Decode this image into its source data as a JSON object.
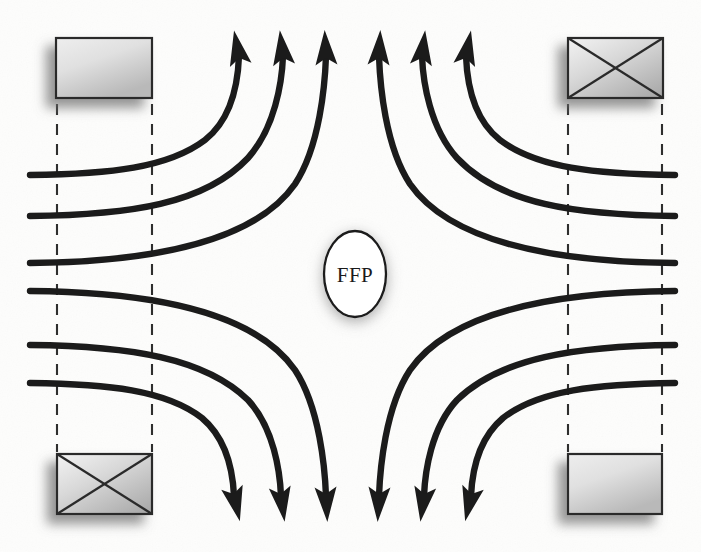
{
  "figure": {
    "name": "field-free-point-diagram",
    "width": 701,
    "height": 552,
    "background_color": "#fdfdfc",
    "line_color": "#1b1b1b",
    "dashed_line_color": "#2a2a2a",
    "box_fill_light": "#e8e8e8",
    "box_fill_dark": "#b4b4b4",
    "box_stroke": "#2a2a2a",
    "shadow_color": "#9a9a9a"
  },
  "center_marker": {
    "label": "FFP",
    "shape": "ellipse",
    "cx": 355,
    "cy": 274,
    "rx": 31,
    "ry": 43,
    "fill": "#ffffff",
    "stroke": "#1a1a1a"
  },
  "magnets": [
    {
      "id": "magnet-top-left",
      "position": "top-left",
      "style": "plain",
      "x": 56,
      "y": 38,
      "width": 96,
      "height": 60
    },
    {
      "id": "magnet-top-right",
      "position": "top-right",
      "style": "crossed",
      "x": 568,
      "y": 38,
      "width": 95,
      "height": 60
    },
    {
      "id": "magnet-bottom-left",
      "position": "bottom-left",
      "style": "crossed",
      "x": 57,
      "y": 454,
      "width": 95,
      "height": 60
    },
    {
      "id": "magnet-bottom-right",
      "position": "bottom-right",
      "style": "plain",
      "x": 568,
      "y": 454,
      "width": 94,
      "height": 60
    }
  ],
  "dashed_guides": [
    {
      "id": "guide-left-inner",
      "x": 57,
      "y1": 104,
      "y2": 450
    },
    {
      "id": "guide-left-outer",
      "x": 152,
      "y1": 104,
      "y2": 450
    },
    {
      "id": "guide-right-inner",
      "x": 568,
      "y1": 104,
      "y2": 450
    },
    {
      "id": "guide-right-outer",
      "x": 662,
      "y1": 104,
      "y2": 450
    }
  ],
  "field_lines": {
    "count": 12,
    "description": "Quadrupole magnetic field lines converging on a field-free point",
    "upper_left_group": [
      {
        "id": "fl-ul-1",
        "start": [
          30,
          175
        ],
        "arrow_tip": [
          228,
          30
        ],
        "arrow_angle": -12
      },
      {
        "id": "fl-ul-2",
        "start": [
          30,
          216
        ],
        "arrow_tip": [
          272,
          30
        ],
        "arrow_angle": -10
      },
      {
        "id": "fl-ul-3",
        "start": [
          30,
          263
        ],
        "arrow_tip": [
          318,
          30
        ],
        "arrow_angle": -6
      }
    ],
    "upper_right_group": [
      {
        "id": "fl-ur-1",
        "start": [
          675,
          175
        ],
        "arrow_tip": [
          488,
          30
        ],
        "arrow_angle": 12
      },
      {
        "id": "fl-ur-2",
        "start": [
          675,
          216
        ],
        "arrow_tip": [
          440,
          30
        ],
        "arrow_angle": 10
      },
      {
        "id": "fl-ur-3",
        "start": [
          675,
          263
        ],
        "arrow_tip": [
          392,
          30
        ],
        "arrow_angle": 6
      }
    ],
    "lower_left_group": [
      {
        "id": "fl-ll-1",
        "start": [
          30,
          291
        ],
        "arrow_tip": [
          318,
          522
        ],
        "arrow_angle": 6
      },
      {
        "id": "fl-ll-2",
        "start": [
          30,
          345
        ],
        "arrow_tip": [
          270,
          522
        ],
        "arrow_angle": 10
      },
      {
        "id": "fl-ll-3",
        "start": [
          30,
          383
        ],
        "arrow_tip": [
          222,
          522
        ],
        "arrow_angle": 14
      }
    ],
    "lower_right_group": [
      {
        "id": "fl-lr-1",
        "start": [
          675,
          291
        ],
        "arrow_tip": [
          392,
          522
        ],
        "arrow_angle": -6
      },
      {
        "id": "fl-lr-2",
        "start": [
          675,
          345
        ],
        "arrow_tip": [
          440,
          522
        ],
        "arrow_angle": -10
      },
      {
        "id": "fl-lr-3",
        "start": [
          675,
          383
        ],
        "arrow_tip": [
          488,
          522
        ],
        "arrow_angle": -14
      }
    ]
  }
}
